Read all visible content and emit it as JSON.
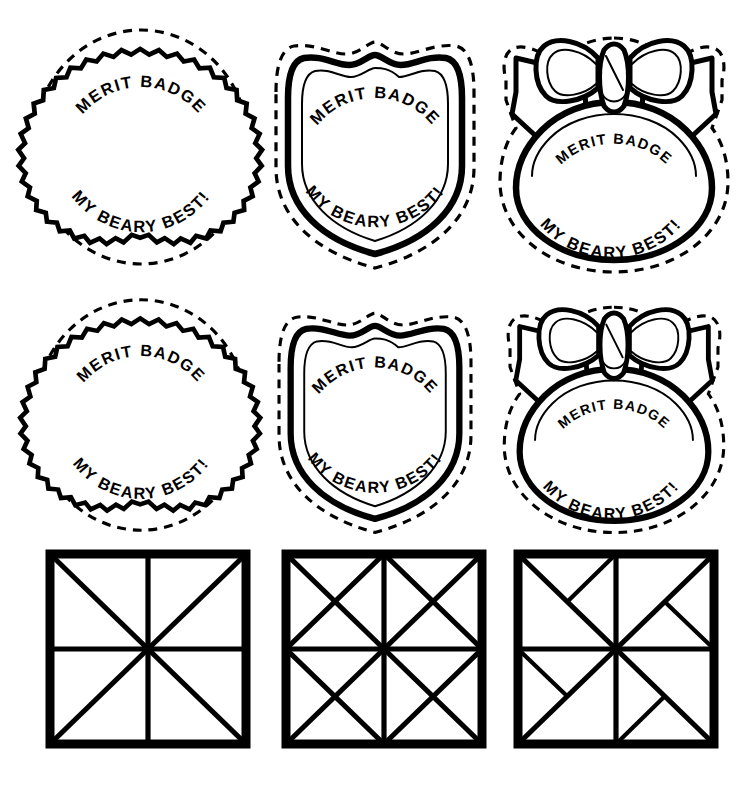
{
  "page": {
    "background_color": "#ffffff",
    "ink_color": "#000000",
    "width": 746,
    "height": 792,
    "columns": 3,
    "rows": 3
  },
  "badge_text": {
    "top_line": "MERIT BADGE",
    "bottom_line": "MY BEARY BEST!"
  },
  "badges": [
    {
      "id": "circle-starburst",
      "shape_name": "starburst-circle-badge",
      "row": 1,
      "column": 1,
      "top_line": "MERIT BADGE",
      "bottom_line": "MY BEARY BEST!",
      "has_dashed_cutline": true,
      "edge_style": "zigzag",
      "zigzag_points": 34
    },
    {
      "id": "shield",
      "shape_name": "shield-badge",
      "row": 1,
      "column": 2,
      "top_line": "MERIT BADGE",
      "bottom_line": "MY BEARY BEST!",
      "has_dashed_cutline": true,
      "edge_style": "double-outline-shield"
    },
    {
      "id": "bow-ribbon",
      "shape_name": "bow-ribbon-badge",
      "row": 1,
      "column": 3,
      "top_line": "MERIT BADGE",
      "bottom_line": "MY BEARY BEST!",
      "has_dashed_cutline": true,
      "edge_style": "ribbon-bow-with-rounded-medallion"
    },
    {
      "id": "circle-starburst-2",
      "shape_name": "starburst-circle-badge",
      "row": 2,
      "column": 1,
      "top_line": "MERIT BADGE",
      "bottom_line": "MY BEARY BEST!",
      "has_dashed_cutline": true,
      "edge_style": "zigzag",
      "zigzag_points": 34
    },
    {
      "id": "shield-2",
      "shape_name": "shield-badge",
      "row": 2,
      "column": 2,
      "top_line": "MERIT BADGE",
      "bottom_line": "MY BEARY BEST!",
      "has_dashed_cutline": true,
      "edge_style": "double-outline-shield"
    },
    {
      "id": "bow-ribbon-2",
      "shape_name": "bow-ribbon-badge",
      "row": 2,
      "column": 3,
      "top_line": "MERIT BADGE",
      "bottom_line": "MY BEARY BEST!",
      "has_dashed_cutline": true,
      "edge_style": "ribbon-bow-with-rounded-medallion"
    }
  ],
  "quilt_blocks": [
    {
      "id": "block-eight-point",
      "name": "eight-point-star-block",
      "row": 3,
      "column": 1,
      "description": "Square with center cross and both full diagonals",
      "segments": [
        "outer-frame",
        "vertical-midline",
        "horizontal-midline",
        "diagonal-tl-br",
        "diagonal-tr-bl"
      ]
    },
    {
      "id": "block-diamond",
      "name": "diamond-in-square-block",
      "row": 3,
      "column": 2,
      "description": "Square with center cross, both full diagonals and an inscribed diamond joining edge midpoints",
      "segments": [
        "outer-frame",
        "vertical-midline",
        "horizontal-midline",
        "diagonal-tl-br",
        "diagonal-tr-bl",
        "inscribed-diamond"
      ]
    },
    {
      "id": "block-pinwheel",
      "name": "pinwheel-block",
      "row": 3,
      "column": 3,
      "description": "Square with center cross, both full diagonals and four short pinwheel spokes",
      "segments": [
        "outer-frame",
        "vertical-midline",
        "horizontal-midline",
        "diagonal-tl-br",
        "diagonal-tr-bl",
        "pinwheel-spokes"
      ]
    }
  ]
}
